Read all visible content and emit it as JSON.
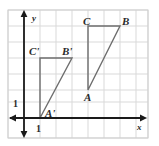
{
  "figure": {
    "kind": "coordinate-grid-dilation-diagram",
    "background_color": "#ffffff",
    "grid": {
      "line_color": "#d8d8d8",
      "border_color": "#cfcfcf",
      "cell_size_px": 16,
      "left_px": 8,
      "top_px": 10,
      "right_px": 148,
      "bottom_px": 138,
      "columns": 9,
      "rows": 8
    },
    "axes": {
      "color": "#1a1a1a",
      "origin_px": {
        "x": 24,
        "y": 118
      },
      "x_axis_label": "x",
      "y_axis_label": "y",
      "x_tick_label": "1",
      "y_tick_label": "1",
      "x_tick_value": 1,
      "y_tick_value": 1
    },
    "shapes": [
      {
        "name": "triangle-abc",
        "label_set": [
          "A",
          "B",
          "C"
        ],
        "stroke_color": "#6e6e6e",
        "vertices_grid": [
          {
            "label": "A",
            "x": 4,
            "y": 2
          },
          {
            "label": "B",
            "x": 6,
            "y": 5.5
          },
          {
            "label": "C",
            "x": 4,
            "y": 5.5
          }
        ]
      },
      {
        "name": "triangle-a-prime-b-prime-c-prime",
        "label_set": [
          "A'",
          "B'",
          "C'"
        ],
        "stroke_color": "#6e6e6e",
        "vertices_grid": [
          {
            "label": "A'",
            "x": 1,
            "y": 0
          },
          {
            "label": "B'",
            "x": 3,
            "y": 2
          },
          {
            "label": "C'",
            "x": 1,
            "y": 2
          }
        ]
      }
    ],
    "vertex_labels": [
      {
        "text": "C",
        "x": 86,
        "y": 26
      },
      {
        "text": "B",
        "x": 124,
        "y": 26
      },
      {
        "text": "C'",
        "x": 31,
        "y": 54
      },
      {
        "text": "B'",
        "x": 64,
        "y": 54
      },
      {
        "text": "A",
        "x": 86,
        "y": 98
      },
      {
        "text": "A'",
        "x": 47,
        "y": 117
      }
    ],
    "axis_labels": [
      {
        "text": "y",
        "x": 32,
        "y": 21
      },
      {
        "text": "x",
        "x": 139,
        "y": 129
      }
    ],
    "tick_labels": [
      {
        "text": "1",
        "x": 14,
        "y": 107
      },
      {
        "text": "1",
        "x": 27,
        "y": 131
      }
    ]
  }
}
